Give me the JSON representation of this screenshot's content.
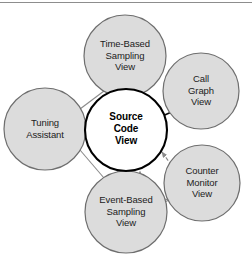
{
  "figure": {
    "type": "node-link-diagram",
    "width": 252,
    "height": 259,
    "colors": {
      "node_fill": "#dcdcdc",
      "node_stroke": "#6e6e6e",
      "center_fill": "#ffffff",
      "center_stroke": "#000000",
      "edge_gray": "#8a8a8a",
      "edge_black": "#111111",
      "background": "#ffffff",
      "top_rule": "#8d8d8d"
    }
  },
  "nodes": [
    {
      "id": "time-based-sampling-view",
      "label": "Time-Based\nSampling\nView",
      "cx": 125,
      "cy": 56,
      "r": 41,
      "emphasis": "normal"
    },
    {
      "id": "call-graph-view",
      "label": "Call\nGraph\nView",
      "cx": 201,
      "cy": 91,
      "r": 38,
      "emphasis": "normal"
    },
    {
      "id": "tuning-assistant",
      "label": "Tuning\nAssistant",
      "cx": 45,
      "cy": 129,
      "r": 41,
      "emphasis": "normal"
    },
    {
      "id": "source-code-view",
      "label": "Source\nCode\nView",
      "cx": 126,
      "cy": 130,
      "r": 41,
      "emphasis": "center"
    },
    {
      "id": "event-based-sampling-view",
      "label": "Event-Based\nSampling\nView",
      "cx": 126,
      "cy": 212,
      "r": 41,
      "emphasis": "normal"
    },
    {
      "id": "counter-monitor-view",
      "label": "Counter\nMonitor\nView",
      "cx": 202,
      "cy": 183,
      "r": 38,
      "emphasis": "normal"
    }
  ],
  "edges": [
    {
      "id": "time-based-to-source-gray",
      "from": "time-based-sampling-view",
      "to": "source-code-view",
      "style": "solid",
      "color": "gray",
      "arrow": "hollow"
    },
    {
      "id": "time-based-to-source-black",
      "from": "time-based-sampling-view",
      "to": "source-code-view",
      "style": "solid",
      "color": "black",
      "arrow": "filled"
    },
    {
      "id": "call-graph-to-source",
      "from": "call-graph-view",
      "to": "source-code-view",
      "style": "solid",
      "color": "black",
      "arrow": "filled"
    },
    {
      "id": "event-based-to-source-gray",
      "from": "event-based-sampling-view",
      "to": "source-code-view",
      "style": "solid",
      "color": "gray",
      "arrow": "hollow"
    },
    {
      "id": "event-based-to-source-black",
      "from": "event-based-sampling-view",
      "to": "source-code-view",
      "style": "solid",
      "color": "black",
      "arrow": "filled"
    },
    {
      "id": "counter-monitor-to-source",
      "from": "counter-monitor-view",
      "to": "source-code-view",
      "style": "dashed",
      "color": "gray",
      "arrow": "filled"
    },
    {
      "id": "counter-monitor-to-source-vertical",
      "from": "counter-monitor-view",
      "to": "source-code-view",
      "style": "dashed",
      "color": "gray",
      "arrow": "filled"
    },
    {
      "id": "counter-monitor-to-event-based",
      "from": "counter-monitor-view",
      "to": "event-based-sampling-view",
      "style": "dashed",
      "color": "gray",
      "arrow": "none"
    },
    {
      "id": "tuning-assistant-to-time-based",
      "from": "tuning-assistant",
      "to": "time-based-sampling-view",
      "style": "solid",
      "color": "gray",
      "arrow": "none"
    },
    {
      "id": "tuning-assistant-to-event-based",
      "from": "tuning-assistant",
      "to": "event-based-sampling-view",
      "style": "solid",
      "color": "gray",
      "arrow": "none"
    }
  ]
}
